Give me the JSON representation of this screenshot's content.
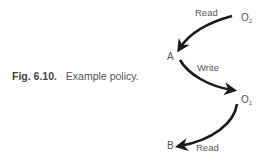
{
  "caption": {
    "figure_number": "Fig. 6.10.",
    "text": "Example policy."
  },
  "nodes": {
    "o2": {
      "base": "O",
      "sub": "2"
    },
    "a": {
      "label": "A"
    },
    "o1": {
      "base": "O",
      "sub": "1"
    },
    "b": {
      "label": "B"
    }
  },
  "edges": [
    {
      "from": "O2",
      "to": "A",
      "label": "Read"
    },
    {
      "from": "A",
      "to": "O1",
      "label": "Write"
    },
    {
      "from": "O1",
      "to": "B",
      "label": "Read"
    }
  ],
  "colors": {
    "arrow": "#1a1a1a",
    "text": "#555555"
  }
}
